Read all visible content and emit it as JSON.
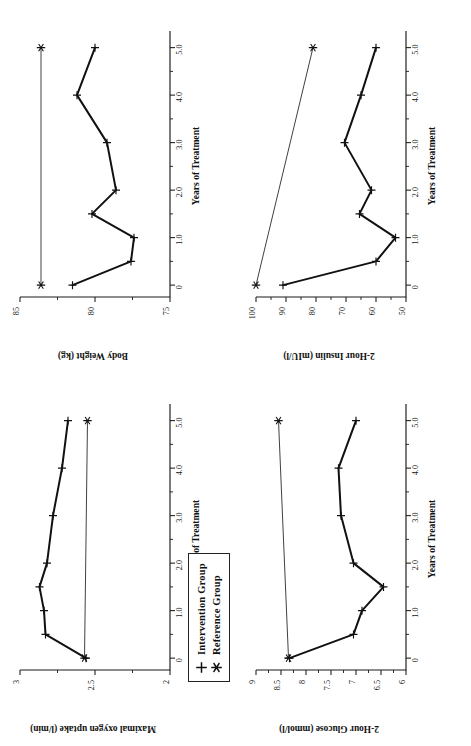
{
  "page": {
    "faint_header": "· ·   ·          ·                    ·",
    "background": "#ffffff",
    "ink": "#111111"
  },
  "legend": {
    "name": "series-legend",
    "items": [
      {
        "label": "Intervention Group",
        "marker": "plus-marker"
      },
      {
        "label": "Reference Group",
        "marker": "asterisk-marker"
      }
    ]
  },
  "shared": {
    "xlabel": "Years of Treatment",
    "xticks": [
      "0",
      "1.0",
      "2.0",
      "3.0",
      "4.0",
      "5.0"
    ],
    "xtickvals": [
      0,
      1,
      2,
      3,
      4,
      5
    ],
    "xlim": [
      -0.25,
      5.35
    ]
  },
  "panels": {
    "vo2": {
      "title_y": "Maximal oxygen uptake (l/min)"
    },
    "weight": {
      "title_y": "Body Weight (kg)"
    },
    "glucose": {
      "title_y": "2-Hour Glucose (mmol/l)"
    },
    "insulin": {
      "title_y": "2-Hour Insulin (mIU/l)"
    }
  },
  "chart_data": [
    {
      "id": "vo2",
      "type": "line",
      "title": "",
      "xlabel": "Years of Treatment",
      "ylabel": "Maximal oxygen uptake (l/min)",
      "xlim": [
        -0.25,
        5.35
      ],
      "ylim": [
        2,
        3
      ],
      "yticks": [
        2,
        2.5,
        3
      ],
      "yticklabels": [
        "2",
        "2.5",
        "3"
      ],
      "xticks": [
        0,
        1,
        2,
        3,
        4,
        5
      ],
      "xticklabels": [
        "0",
        "1.0",
        "2.0",
        "3.0",
        "4.0",
        "5.0"
      ],
      "grid": false,
      "legend_position": "top-left-outside",
      "series": [
        {
          "name": "Intervention Group",
          "marker": "plus",
          "x": [
            0,
            0.5,
            1.0,
            1.5,
            2.0,
            3.0,
            4.0,
            5.0
          ],
          "values": [
            2.56,
            2.83,
            2.84,
            2.87,
            2.82,
            2.78,
            2.72,
            2.68
          ]
        },
        {
          "name": "Reference Group",
          "marker": "asterisk",
          "x": [
            0,
            5.0
          ],
          "values": [
            2.57,
            2.55
          ]
        }
      ]
    },
    {
      "id": "weight",
      "type": "line",
      "title": "",
      "xlabel": "Years of Treatment",
      "ylabel": "Body Weight (kg)",
      "xlim": [
        -0.25,
        5.35
      ],
      "ylim": [
        75,
        85
      ],
      "yticks": [
        75,
        80,
        85
      ],
      "yticklabels": [
        "75",
        "80",
        "85"
      ],
      "xticks": [
        0,
        1,
        2,
        3,
        4,
        5
      ],
      "xticklabels": [
        "0",
        "1.0",
        "2.0",
        "3.0",
        "4.0",
        "5.0"
      ],
      "grid": false,
      "series": [
        {
          "name": "Intervention Group",
          "marker": "plus",
          "x": [
            0,
            0.5,
            1.0,
            1.5,
            2.0,
            3.0,
            4.0,
            5.0
          ],
          "values": [
            81.5,
            77.6,
            77.4,
            80.2,
            78.6,
            79.2,
            81.2,
            80.0
          ]
        },
        {
          "name": "Reference Group",
          "marker": "asterisk",
          "x": [
            0,
            5.0
          ],
          "values": [
            83.6,
            83.6
          ]
        }
      ]
    },
    {
      "id": "glucose",
      "type": "line",
      "title": "",
      "xlabel": "Years of Treatment",
      "ylabel": "2-Hour Glucose (mmol/l)",
      "xlim": [
        -0.25,
        5.35
      ],
      "ylim": [
        6,
        9
      ],
      "yticks": [
        6,
        6.5,
        7,
        7.5,
        8,
        8.5,
        9
      ],
      "yticklabels": [
        "6",
        "6.5",
        "7",
        "7.5",
        "8",
        "8.5",
        "9"
      ],
      "xticks": [
        0,
        1,
        2,
        3,
        4,
        5
      ],
      "xticklabels": [
        "0",
        "1.0",
        "2.0",
        "3.0",
        "4.0",
        "5.0"
      ],
      "grid": false,
      "series": [
        {
          "name": "Intervention Group",
          "marker": "plus",
          "x": [
            0,
            0.5,
            1.0,
            1.5,
            2.0,
            3.0,
            4.0,
            5.0
          ],
          "values": [
            8.33,
            7.05,
            6.88,
            6.45,
            7.05,
            7.3,
            7.35,
            7.0
          ]
        },
        {
          "name": "Reference Group",
          "marker": "asterisk",
          "x": [
            0,
            5.0
          ],
          "values": [
            8.35,
            8.55
          ]
        }
      ]
    },
    {
      "id": "insulin",
      "type": "line",
      "title": "",
      "xlabel": "Years of Treatment",
      "ylabel": "2-Hour Insulin (mIU/l)",
      "xlim": [
        -0.25,
        5.35
      ],
      "ylim": [
        50,
        100
      ],
      "yticks": [
        50,
        60,
        70,
        80,
        90,
        100
      ],
      "yticklabels": [
        "50",
        "60",
        "70",
        "80",
        "90",
        "100"
      ],
      "xticks": [
        0,
        1,
        2,
        3,
        4,
        5
      ],
      "xticklabels": [
        "0",
        "1.0",
        "2.0",
        "3.0",
        "4.0",
        "5.0"
      ],
      "grid": false,
      "series": [
        {
          "name": "Intervention Group",
          "marker": "plus",
          "x": [
            0,
            0.5,
            1.0,
            1.5,
            2.0,
            3.0,
            4.0,
            5.0
          ],
          "values": [
            91,
            60,
            53.5,
            65.5,
            61.5,
            70.5,
            65,
            60
          ]
        },
        {
          "name": "Reference Group",
          "marker": "asterisk",
          "x": [
            0,
            5.0
          ],
          "values": [
            100,
            81
          ]
        }
      ]
    }
  ]
}
